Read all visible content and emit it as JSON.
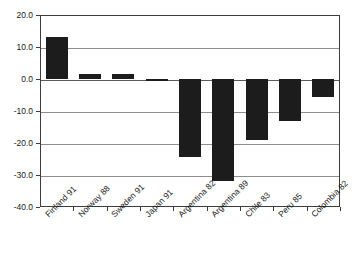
{
  "chart_data": {
    "type": "bar",
    "title": "",
    "title_clipped": true,
    "xlabel": "",
    "ylabel": "",
    "ylim": [
      -40.0,
      20.0
    ],
    "ytick_labels": [
      "20.0",
      "10.0",
      "0.0",
      "-10.0",
      "-20.0",
      "-30.0",
      "-40.0"
    ],
    "ytick_values": [
      20.0,
      10.0,
      0.0,
      -10.0,
      -20.0,
      -30.0,
      -40.0
    ],
    "grid": true,
    "grid_axis": "y",
    "legend": false,
    "bar_color": "#1c1c1c",
    "categories": [
      "Finland 91",
      "Norway 88",
      "Sweden 91",
      "Japan 91",
      "Argentina 82",
      "Argentina 89",
      "Chile 83",
      "Peru 85",
      "Colombia 82"
    ],
    "values": [
      13.0,
      1.5,
      1.5,
      -0.3,
      -24.5,
      -32.0,
      -19.0,
      -13.0,
      -5.5
    ]
  },
  "axis": {
    "frame_color": "#3d3d3d",
    "gridline_color": "#8e8e8e"
  }
}
